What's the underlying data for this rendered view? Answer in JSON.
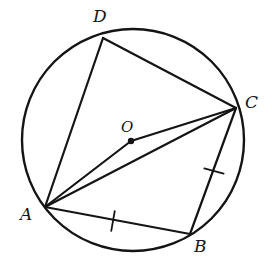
{
  "figure": {
    "kind": "circle-geometry-diagram",
    "width": 272,
    "height": 265,
    "background_color": "#ffffff",
    "stroke_color": "#141414",
    "label_color": "#141414"
  },
  "circle": {
    "name": "circumscribed-circle",
    "center_x": 133,
    "center_y": 140,
    "radius": 111,
    "stroke_width": 2.4
  },
  "center_point": {
    "label": "O",
    "x": 131,
    "y": 141,
    "dot_radius": 3.2,
    "label_x": 121,
    "label_y": 120
  },
  "points": [
    {
      "label": "A",
      "x": 45,
      "y": 207,
      "label_x": 20,
      "label_y": 206
    },
    {
      "label": "B",
      "x": 190,
      "y": 234,
      "label_x": 194,
      "label_y": 238
    },
    {
      "label": "C",
      "x": 236,
      "y": 108,
      "label_x": 245,
      "label_y": 94
    },
    {
      "label": "D",
      "x": 103,
      "y": 38,
      "label_x": 93,
      "label_y": 8
    }
  ],
  "chords": [
    {
      "name": "chord-AD",
      "from": "A",
      "to": "D",
      "x1": 45,
      "y1": 207,
      "x2": 103,
      "y2": 38,
      "stroke_width": 2.2
    },
    {
      "name": "chord-DC",
      "from": "D",
      "to": "C",
      "x1": 103,
      "y1": 38,
      "x2": 236,
      "y2": 108,
      "stroke_width": 2.2
    },
    {
      "name": "chord-CB",
      "from": "C",
      "to": "B",
      "x1": 236,
      "y1": 108,
      "x2": 190,
      "y2": 234,
      "stroke_width": 2.2
    },
    {
      "name": "chord-BA",
      "from": "B",
      "to": "A",
      "x1": 190,
      "y1": 234,
      "x2": 45,
      "y2": 207,
      "stroke_width": 2.2
    },
    {
      "name": "chord-AC",
      "from": "A",
      "to": "C",
      "x1": 45,
      "y1": 207,
      "x2": 236,
      "y2": 108,
      "stroke_width": 2.2
    },
    {
      "name": "segment-A-through-O-to-C",
      "from": "A",
      "to": "C",
      "x1": 45,
      "y1": 207,
      "x2": 236,
      "y2": 108,
      "via_x": 131,
      "via_y": 141,
      "stroke_width": 2.2
    }
  ],
  "tick_marks": [
    {
      "name": "tick-on-AB",
      "on_segment": "AB",
      "x": 113,
      "y": 221,
      "angle_deg": 100,
      "length": 20
    },
    {
      "name": "tick-on-BC",
      "on_segment": "BC",
      "x": 214,
      "y": 171,
      "angle_deg": 15,
      "length": 20
    }
  ],
  "congruence_note": "single tick on AB and single tick on BC indicates AB = BC"
}
